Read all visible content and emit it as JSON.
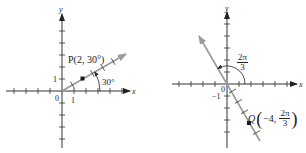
{
  "figure": {
    "left": {
      "axis_x_label": "x",
      "axis_y_label": "y",
      "origin_label": "0",
      "x_tick_label": "1",
      "y_tick_label": "1",
      "point_label": "P(2, 30°)",
      "angle_label": "30°",
      "point": {
        "r": 2,
        "theta_deg": 30
      }
    },
    "right": {
      "axis_x_label": "x",
      "axis_y_label": "y",
      "origin_label": "0",
      "y_tick_label": "−1",
      "angle_label_num": "2π",
      "angle_label_den": "3",
      "point_prefix": "Q",
      "point_r": "−4,",
      "point_theta_num": "2π",
      "point_theta_den": "3",
      "point": {
        "r": -4,
        "theta": "2π/3"
      }
    },
    "colors": {
      "axis": "#333333",
      "ray": "#9a9a9a",
      "point": "#1a1a1a"
    }
  }
}
